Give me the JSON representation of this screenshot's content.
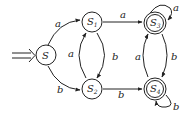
{
  "diagram": {
    "type": "finite-automaton",
    "states": [
      {
        "id": "S",
        "label": "S",
        "sub": "",
        "start": true,
        "accept": false
      },
      {
        "id": "S1",
        "label": "S",
        "sub": "1",
        "start": false,
        "accept": false
      },
      {
        "id": "S2",
        "label": "S",
        "sub": "2",
        "start": false,
        "accept": false
      },
      {
        "id": "S3",
        "label": "S",
        "sub": "3",
        "start": false,
        "accept": true
      },
      {
        "id": "S4",
        "label": "S",
        "sub": "4",
        "start": false,
        "accept": true
      }
    ],
    "transitions": [
      {
        "from": "S",
        "to": "S1",
        "symbol": "a"
      },
      {
        "from": "S",
        "to": "S2",
        "symbol": "b"
      },
      {
        "from": "S1",
        "to": "S3",
        "symbol": "a"
      },
      {
        "from": "S1",
        "to": "S2",
        "symbol": "b"
      },
      {
        "from": "S2",
        "to": "S1",
        "symbol": "a"
      },
      {
        "from": "S2",
        "to": "S4",
        "symbol": "b"
      },
      {
        "from": "S3",
        "to": "S3",
        "symbol": "a"
      },
      {
        "from": "S3",
        "to": "S4",
        "symbol": "b"
      },
      {
        "from": "S4",
        "to": "S3",
        "symbol": "a"
      },
      {
        "from": "S4",
        "to": "S4",
        "symbol": "b"
      }
    ],
    "colors": {
      "stroke": "#222222",
      "background": "#ffffff"
    }
  }
}
